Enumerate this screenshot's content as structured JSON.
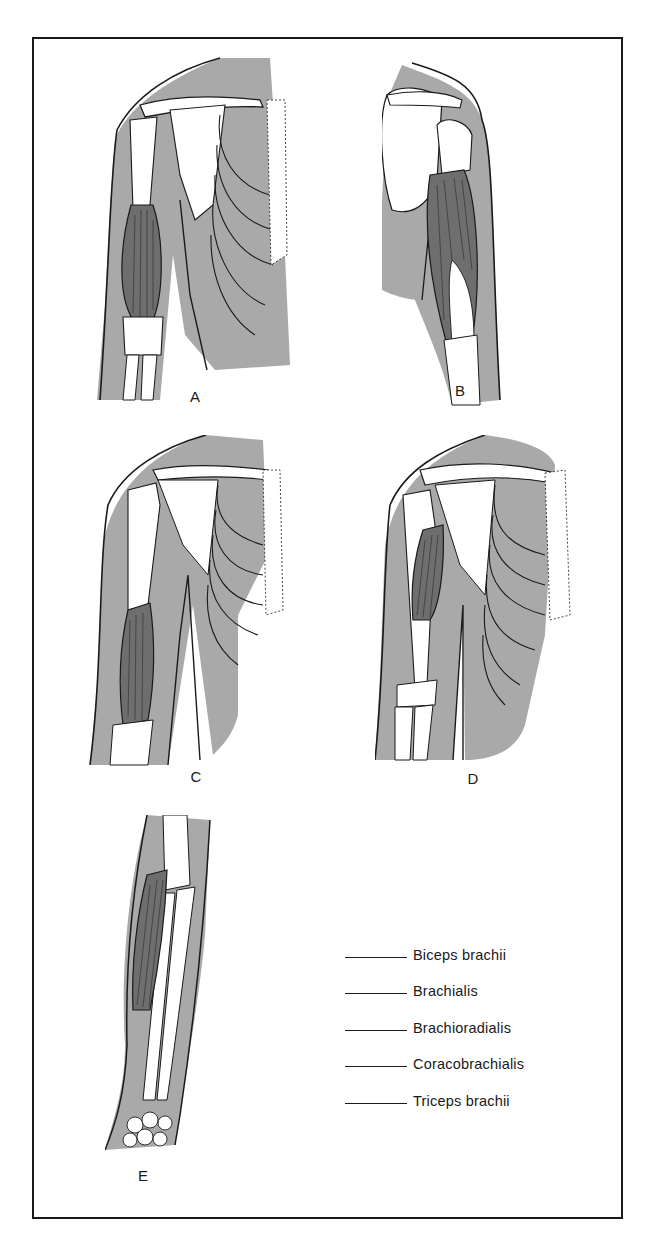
{
  "figure": {
    "panels": [
      {
        "id": "A",
        "label": "A",
        "view": "anterior shoulder and arm, long fusiform muscle highlighted"
      },
      {
        "id": "B",
        "label": "B",
        "view": "posterior shoulder and arm, muscle on back of arm highlighted"
      },
      {
        "id": "C",
        "label": "C",
        "view": "anterior arm, distal muscle over humerus highlighted"
      },
      {
        "id": "D",
        "label": "D",
        "view": "anterior shoulder, small upper-arm muscle highlighted"
      },
      {
        "id": "E",
        "label": "E",
        "view": "forearm, lateral muscle highlighted"
      }
    ],
    "key": {
      "blank": "______",
      "items": [
        {
          "label": "Biceps brachii"
        },
        {
          "label": "Brachialis"
        },
        {
          "label": "Brachioradialis"
        },
        {
          "label": "Coracobrachialis"
        },
        {
          "label": "Triceps brachii"
        }
      ]
    },
    "colors": {
      "skin_shade": "#a9a9a9",
      "outline": "#1a1a1a",
      "bone": "#ffffff",
      "muscle": "#6e6e6e"
    }
  }
}
